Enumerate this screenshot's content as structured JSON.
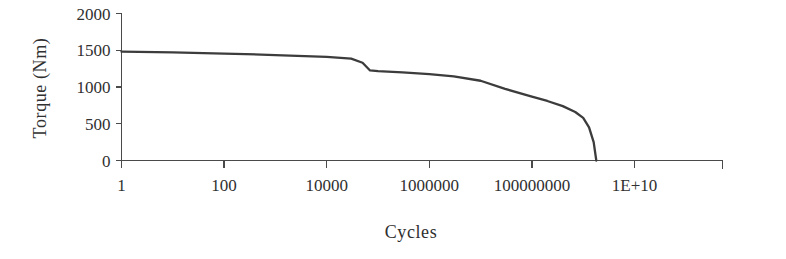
{
  "chart_data": {
    "type": "line",
    "title": "",
    "xlabel": "Cycles",
    "ylabel": "Torque (Nm)",
    "xscale": "log",
    "yscale": "linear",
    "xlim": [
      1,
      10000000000
    ],
    "ylim": [
      0,
      2000
    ],
    "grid": false,
    "legend": "none",
    "x_tick_labels": [
      "1",
      "100",
      "10000",
      "1000000",
      "100000000",
      "1E+10"
    ],
    "x_tick_values": [
      1,
      100,
      10000,
      1000000,
      100000000,
      10000000000
    ],
    "y_tick_labels": [
      "0",
      "500",
      "1000",
      "1500",
      "2000"
    ],
    "y_tick_values": [
      0,
      500,
      1000,
      1500,
      2000
    ],
    "series": [
      {
        "name": "Torque capacity",
        "x": [
          1,
          10,
          100,
          1000,
          10000,
          30000,
          50000,
          70000,
          100000,
          300000,
          1000000,
          3000000,
          10000000,
          30000000,
          100000000,
          200000000,
          400000000,
          700000000,
          1000000000,
          1300000000,
          1600000000,
          1800000000
        ],
        "values": [
          1480,
          1470,
          1455,
          1435,
          1410,
          1385,
          1330,
          1225,
          1215,
          1200,
          1175,
          1145,
          1085,
          975,
          870,
          810,
          740,
          660,
          580,
          450,
          250,
          0
        ]
      }
    ]
  },
  "axis": {
    "y_title": "Torque (Nm)",
    "x_title": "Cycles"
  }
}
